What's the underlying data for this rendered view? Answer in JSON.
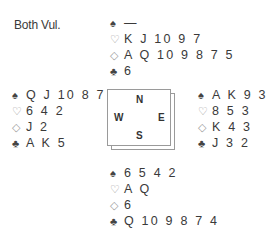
{
  "vulnerability": "Both Vul.",
  "suits": {
    "spade": "♠",
    "heart": "♡",
    "diamond": "◇",
    "club": "♣"
  },
  "compass": {
    "north": "N",
    "south": "S",
    "west": "W",
    "east": "E"
  },
  "hands": {
    "north": {
      "spades": "—",
      "hearts": "K J 10 9 7",
      "diamonds": "A Q 10 9 8 7 5",
      "clubs": "6"
    },
    "west": {
      "spades": "Q J 10 8 7",
      "hearts": "6 4 2",
      "diamonds": "J 2",
      "clubs": "A K 5"
    },
    "east": {
      "spades": "A K 9 3",
      "hearts": "8 5 3",
      "diamonds": "K 4 3",
      "clubs": "J 3 2"
    },
    "south": {
      "spades": "6 5 4 2",
      "hearts": "A Q",
      "diamonds": "6",
      "clubs": "Q 10 9 8 7 4"
    }
  }
}
